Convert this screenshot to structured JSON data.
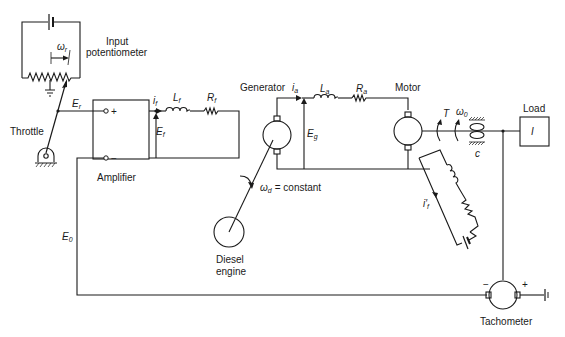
{
  "figure": {
    "type": "schematic"
  },
  "labels": {
    "input_potentiometer_line1": "Input",
    "input_potentiometer_line2": "potentiometer",
    "omega_r": "ω",
    "omega_r_sub": "r",
    "throttle": "Throttle",
    "E_r": "E",
    "E_r_sub": "r",
    "amplifier": "Amplifier",
    "amp_plus": "+",
    "amp_minus": "−",
    "i_f": "i",
    "i_f_sub": "f",
    "L_f": "L",
    "L_f_sub": "f",
    "R_f": "R",
    "R_f_sub": "f",
    "E_f": "E",
    "E_f_sub": "f",
    "generator": "Generator",
    "i_a": "i",
    "i_a_sub": "a",
    "L_a": "L",
    "L_a_sub": "a",
    "R_a": "R",
    "R_a_sub": "a",
    "E_g": "E",
    "E_g_sub": "g",
    "motor": "Motor",
    "torque": "T",
    "omega_0": "ω",
    "omega_0_sub": "0",
    "damping": "c",
    "load": "Load",
    "inertia": "I",
    "omega_d": "ω",
    "omega_d_sub": "d",
    "omega_d_text": "= constant",
    "diesel_line1": "Diesel",
    "diesel_line2": "engine",
    "i_f_prime": "i′",
    "i_f_prime_sub": "f",
    "E_0": "E",
    "E_0_sub": "0",
    "tach_minus": "−",
    "tach_plus": "+",
    "tachometer": "Tachometer"
  }
}
